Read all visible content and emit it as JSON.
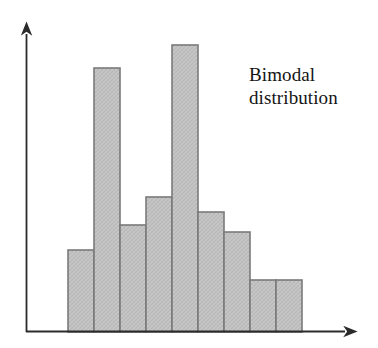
{
  "figure": {
    "background_color": "#ffffff",
    "annotation": {
      "name": "bimodal-distribution-label",
      "line1": "Bimodal",
      "line2": "distribution",
      "text": "Bimodal\ndistribution",
      "color": "#141414"
    },
    "axes": {
      "x_axis_name": "x-axis-arrow",
      "y_axis_name": "y-axis-arrow",
      "line_color": "#2b2b2b",
      "x_label": "",
      "y_label": "",
      "x_ticks": [],
      "y_ticks": []
    },
    "bar_style": {
      "fill": "#c4c4c4",
      "stroke": "#7a7a7a",
      "hatch": "crosshatch"
    }
  },
  "chart_data": {
    "type": "bar",
    "title": "",
    "subtitle": "",
    "xlabel": "",
    "ylabel": "",
    "grid": false,
    "legend": "none",
    "annotations": [
      "Bimodal distribution"
    ],
    "categories": [
      "1",
      "2",
      "3",
      "4",
      "5",
      "6",
      "7",
      "8",
      "9"
    ],
    "values": [
      70,
      82,
      264,
      107,
      135,
      287,
      120,
      100,
      52
    ],
    "ylim": [
      0,
      302
    ],
    "xlim": [
      0,
      10
    ],
    "bar_tops_px": [
      262,
      250,
      68,
      225,
      197,
      45,
      212,
      232,
      280
    ],
    "baseline_px": 332
  }
}
